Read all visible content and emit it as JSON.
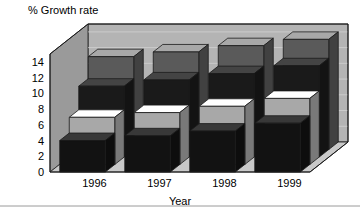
{
  "chart_data": {
    "type": "bar",
    "title": "% Growth rate",
    "subtitle": "",
    "xlabel": "Year",
    "ylabel": "% Growth rate",
    "categories": [
      "1996",
      "1997",
      "1998",
      "1999"
    ],
    "yticks": [
      0,
      2,
      4,
      6,
      8,
      10,
      12,
      14
    ],
    "ylim": [
      0,
      15
    ],
    "grid": true,
    "legend": "none",
    "projection": "3d",
    "series": [
      {
        "name": "Series 1",
        "color": "#121212",
        "values": [
          4.0,
          4.6,
          5.2,
          6.2
        ]
      },
      {
        "name": "Series 2",
        "color": "#a8a8a8",
        "values": [
          6.0,
          6.6,
          7.4,
          8.4
        ]
      },
      {
        "name": "Series 3",
        "color": "#1a1a1a",
        "values": [
          9.0,
          9.8,
          10.6,
          11.6
        ]
      },
      {
        "name": "Series 4",
        "color": "#5a5a5a",
        "values": [
          11.8,
          12.4,
          13.2,
          14.0
        ]
      }
    ]
  },
  "colors": {
    "back_wall": "#b4b4b4",
    "side_wall": "#9a9a9a",
    "floor": "#c9c9c9",
    "gridline": "#d6d6d6",
    "outline": "#1a1a1a",
    "text": "#000000",
    "page_rule": "#9a9a9a"
  },
  "axis": {
    "y_title": "% Growth rate",
    "x_title": "Year"
  }
}
